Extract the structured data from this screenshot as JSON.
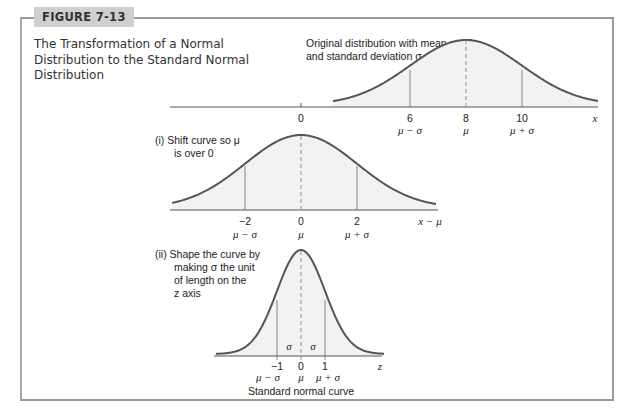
{
  "figure": {
    "tag": "FIGURE 7-13",
    "caption": "The Transformation of a Normal Distribution to the Standard Normal Distribution"
  },
  "colors": {
    "curve": "#555555",
    "fill": "#f2f2f2",
    "frame": "#9a9a9a",
    "tag_bg": "#cfcfcf"
  },
  "panels": {
    "original": {
      "note_line1": "Original distribution with mean μ = 8",
      "note_line2": "and standard deviation σ = 2",
      "axis_label": "x",
      "ticks": [
        {
          "value": "0",
          "sub": ""
        },
        {
          "value": "6",
          "sub": "μ − σ"
        },
        {
          "value": "8",
          "sub": "μ"
        },
        {
          "value": "10",
          "sub": "μ + σ"
        }
      ]
    },
    "shift": {
      "note_line1": "(i)  Shift curve so μ",
      "note_line2": "is over 0",
      "axis_label": "x − μ",
      "ticks": [
        {
          "value": "−2",
          "sub": "μ − σ"
        },
        {
          "value": "0",
          "sub": "μ"
        },
        {
          "value": "2",
          "sub": "μ + σ"
        }
      ]
    },
    "standard": {
      "note_line1": "(ii)  Shape the curve by",
      "note_line2": "making σ the unit",
      "note_line3": "of length on the",
      "note_line4": "z axis",
      "axis_label": "z",
      "sigma_label": "σ",
      "ticks": [
        {
          "value": "−1",
          "sub": "μ − σ"
        },
        {
          "value": "0",
          "sub": "μ"
        },
        {
          "value": "1",
          "sub": "μ + σ"
        }
      ],
      "caption": "Standard normal curve"
    }
  },
  "chart_data": [
    {
      "type": "line",
      "title": "Original distribution",
      "xlabel": "x",
      "mean": 8,
      "sd": 2,
      "x_ticks": [
        0,
        6,
        8,
        10
      ],
      "tick_sublabels": [
        "",
        "μ − σ",
        "μ",
        "μ + σ"
      ]
    },
    {
      "type": "line",
      "title": "(i) Shift curve so μ is over 0",
      "xlabel": "x − μ",
      "mean": 0,
      "sd": 2,
      "x_ticks": [
        -2,
        0,
        2
      ],
      "tick_sublabels": [
        "μ − σ",
        "μ",
        "μ + σ"
      ]
    },
    {
      "type": "line",
      "title": "(ii) Shape the curve by making σ the unit of length on the z axis",
      "xlabel": "z",
      "mean": 0,
      "sd": 1,
      "x_ticks": [
        -1,
        0,
        1
      ],
      "tick_sublabels": [
        "μ − σ",
        "μ",
        "μ + σ"
      ],
      "caption": "Standard normal curve"
    }
  ]
}
